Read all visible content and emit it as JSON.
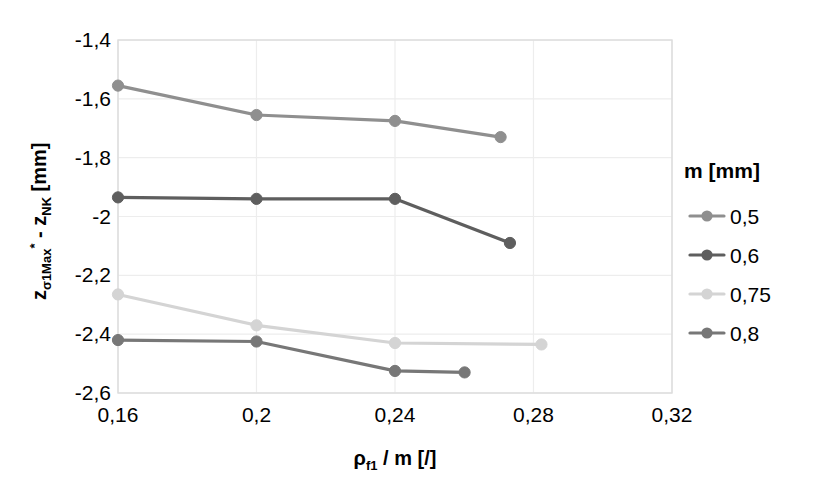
{
  "chart_data": {
    "type": "line",
    "title": "",
    "xlabel": "ρf1 / m [/]",
    "ylabel": "zσ1Max* - zNK [mm]",
    "xlim": [
      0.16,
      0.32
    ],
    "ylim": [
      -2.6,
      -1.4
    ],
    "xticks": [
      0.16,
      0.2,
      0.24,
      0.28,
      0.32
    ],
    "xtick_labels": [
      "0,16",
      "0,2",
      "0,24",
      "0,28",
      "0,32"
    ],
    "yticks": [
      -1.4,
      -1.6,
      -1.8,
      -2.0,
      -2.2,
      -2.4,
      -2.6
    ],
    "ytick_labels": [
      "-1,4",
      "-1,6",
      "-1,8",
      "-2",
      "-2,2",
      "-2,4",
      "-2,6"
    ],
    "grid": true,
    "legend_position": "right",
    "legend_title": "m [mm]",
    "series": [
      {
        "name": "0,5",
        "color": "#8f8f8f",
        "x": [
          0.16,
          0.2,
          0.24,
          0.2705
        ],
        "values": [
          -1.555,
          -1.655,
          -1.675,
          -1.73
        ]
      },
      {
        "name": "0,6",
        "color": "#5e5e5e",
        "x": [
          0.16,
          0.2,
          0.24,
          0.2732
        ],
        "values": [
          -1.935,
          -1.94,
          -1.94,
          -2.09
        ]
      },
      {
        "name": "0,75",
        "color": "#d4d4d4",
        "x": [
          0.16,
          0.2,
          0.24,
          0.2823
        ],
        "values": [
          -2.265,
          -2.37,
          -2.43,
          -2.435
        ]
      },
      {
        "name": "0,8",
        "color": "#777777",
        "x": [
          0.16,
          0.2,
          0.24,
          0.2601
        ],
        "values": [
          -2.42,
          -2.425,
          -2.525,
          -2.53
        ]
      }
    ]
  },
  "axes": {
    "y_axis_parts": {
      "z1": "z",
      "sub1": "σ1Max",
      "star": "*",
      "mid": " - ",
      "z2": "z",
      "sub2": "NK",
      "unit": " [mm]"
    },
    "x_axis_parts": {
      "rho": "ρ",
      "sub": "f1",
      "rest": " / m [/]"
    }
  },
  "legend": {
    "title": "m [mm]",
    "items": [
      {
        "label": "0,5",
        "color": "#8f8f8f"
      },
      {
        "label": "0,6",
        "color": "#5e5e5e"
      },
      {
        "label": "0,75",
        "color": "#d4d4d4"
      },
      {
        "label": "0,8",
        "color": "#777777"
      }
    ]
  },
  "style": {
    "plot_border": "#d9d9d9",
    "gridline": "#ededed",
    "background": "#ffffff"
  }
}
